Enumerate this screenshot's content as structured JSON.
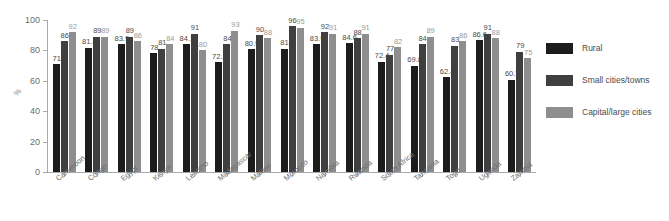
{
  "chart_data": {
    "type": "bar",
    "title": "",
    "xlabel": "",
    "ylabel": "%",
    "ylim": [
      0,
      100
    ],
    "yticks": [
      0,
      20,
      40,
      60,
      80,
      100
    ],
    "grid": false,
    "legend_position": "right",
    "categories": [
      "Cameroon",
      "Congo",
      "Egypt",
      "Kenya",
      "Lesotho",
      "Madagascar",
      "Malawi",
      "Morocco",
      "Namibia",
      "Rwanda",
      "South Africa",
      "Tanzania",
      "Togo",
      "Uganda",
      "Zambia"
    ],
    "series": [
      {
        "name": "Rural",
        "color": "#1c1c1c",
        "values": [
          71,
          81.8,
          83.9,
          78,
          84.1,
          72.2,
          80.9,
          81,
          83.9,
          84.6,
          72.4,
          69.8,
          62.4,
          86.6,
          60.7
        ],
        "labels": [
          "71",
          "81.8",
          "83.9",
          "78",
          "84.1",
          "72.2",
          "80.9",
          "81",
          "83.9",
          "84.6",
          "72.4",
          "69.8",
          "62.4",
          "86.6",
          "60.7"
        ]
      },
      {
        "name": "Small cities/towns",
        "color": "#3f3f3f",
        "values": [
          86,
          89,
          89,
          81,
          91,
          84,
          90,
          96,
          92,
          88,
          77,
          84,
          83,
          91,
          79
        ],
        "labels": [
          "86",
          "89",
          "89",
          "81",
          "91",
          "84",
          "90",
          "96",
          "92",
          "88",
          "77",
          "84",
          "83",
          "91",
          "79"
        ]
      },
      {
        "name": "Capital/large cities",
        "color": "#8e8e8e",
        "values": [
          92,
          89,
          86,
          84,
          80,
          93,
          88,
          95,
          91,
          91,
          82,
          89,
          86,
          88,
          75
        ],
        "labels": [
          "92",
          "89",
          "86",
          "84",
          "80",
          "93",
          "88",
          "95",
          "91",
          "91",
          "82",
          "89",
          "86",
          "88",
          "75"
        ]
      }
    ]
  },
  "legend": {
    "items": [
      {
        "label": "Rural",
        "color": "#1c1c1c"
      },
      {
        "label": "Small cities/towns",
        "color": "#3f3f3f"
      },
      {
        "label": "Capital/large cities",
        "color": "#8e8e8e"
      }
    ]
  }
}
